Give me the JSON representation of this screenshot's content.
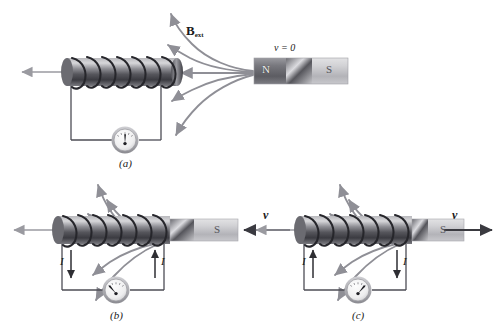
{
  "figure": {
    "colors": {
      "field_line": "#8f8f96",
      "wire": "#4d4d55",
      "magnet_north": "#6e6e74",
      "magnet_south": "#c9c9cc",
      "coil_dark": "#2b2b2f",
      "core_gray": "#9a9aa0",
      "text": "#1a1a1a",
      "axis_arrow": "#9a9aa0",
      "velocity_arrow": "#3a3a40"
    }
  },
  "panels": [
    {
      "id": "a",
      "caption": "(a)",
      "velocity_label": "v = 0",
      "field_label_main": "B",
      "field_label_sub": "ext",
      "magnet": {
        "north_label": "N",
        "south_label": "S",
        "inserted": false
      },
      "current_labels": [],
      "galvanometer": {
        "name": "galvanometer",
        "needle_deflection": "center"
      },
      "velocity_arrow_direction": "none"
    },
    {
      "id": "b",
      "caption": "(b)",
      "velocity_label": "v",
      "magnet": {
        "south_label": "S",
        "inserted": true
      },
      "current_labels": [
        {
          "text": "I",
          "side": "left",
          "arrow": "down"
        },
        {
          "text": "I",
          "side": "right",
          "arrow": "up"
        }
      ],
      "galvanometer": {
        "name": "galvanometer",
        "needle_deflection": "left"
      },
      "velocity_arrow_direction": "left"
    },
    {
      "id": "c",
      "caption": "(c)",
      "velocity_label": "v",
      "magnet": {
        "south_label": "S",
        "inserted": true
      },
      "current_labels": [
        {
          "text": "I",
          "side": "left",
          "arrow": "up"
        },
        {
          "text": "I",
          "side": "right",
          "arrow": "down"
        }
      ],
      "galvanometer": {
        "name": "galvanometer",
        "needle_deflection": "right"
      },
      "velocity_arrow_direction": "right"
    }
  ]
}
